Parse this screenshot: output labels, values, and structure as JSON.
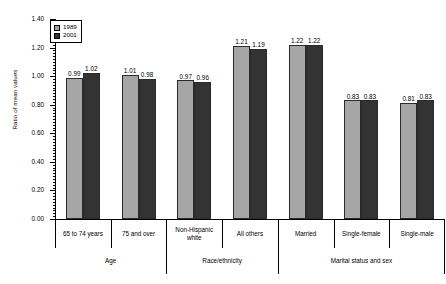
{
  "chart_data": {
    "type": "bar",
    "title": "",
    "xlabel": "",
    "ylabel": "Ratio of mean values",
    "ylim": [
      0.0,
      1.4
    ],
    "ytick_labels": [
      "0.00",
      "0.20",
      "0.40",
      "0.60",
      "0.80",
      "1.00",
      "1.20",
      "1.40"
    ],
    "ytick_values": [
      0.0,
      0.2,
      0.4,
      0.6,
      0.8,
      1.0,
      1.2,
      1.4
    ],
    "minor_tick_step": 0.02,
    "grid": false,
    "legend_position": "top-left",
    "categories": [
      "65 to 74 years",
      "75 and over",
      "Non-Hispanic white",
      "All others",
      "Married",
      "Single-female",
      "Single-male"
    ],
    "groups": [
      {
        "label": "Age",
        "categories": [
          "65 to 74 years",
          "75 and over"
        ]
      },
      {
        "label": "Race/ethnicity",
        "categories": [
          "Non-Hispanic white",
          "All others"
        ]
      },
      {
        "label": "Marital status and sex",
        "categories": [
          "Married",
          "Single-female",
          "Single-male"
        ]
      }
    ],
    "series": [
      {
        "name": "1989",
        "color": "#a6a6a6",
        "values": [
          0.99,
          1.01,
          0.97,
          1.21,
          1.22,
          0.83,
          0.81
        ]
      },
      {
        "name": "2001",
        "color": "#333333",
        "values": [
          1.02,
          0.98,
          0.96,
          1.19,
          1.22,
          0.83,
          0.83
        ]
      }
    ],
    "value_labels": {
      "1989": [
        "0.99",
        "1.01",
        "0.97",
        "1.21",
        "1.22",
        "0.83",
        "0.81"
      ],
      "2001": [
        "1.02",
        "0.98",
        "0.96",
        "1.19",
        "1.22",
        "0.83",
        "0.83"
      ]
    }
  },
  "legend": {
    "items": [
      {
        "label": "1989",
        "swatch": "s1989"
      },
      {
        "label": "2001",
        "swatch": "s2001"
      }
    ]
  },
  "category_labels": [
    "65 to 74 years",
    "75 and over",
    "Non-Hispanic white",
    "All others",
    "Married",
    "Single-female",
    "Single-male"
  ],
  "group_labels": [
    "Age",
    "Race/ethnicity",
    "Marital status and sex"
  ]
}
